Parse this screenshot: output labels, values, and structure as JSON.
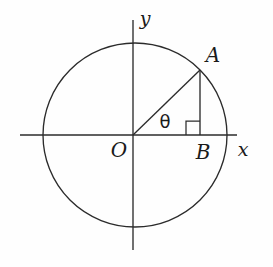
{
  "figure": {
    "background_color": "#fefefe",
    "stroke_color": "#2b2b2b",
    "labels": {
      "y_axis": "y",
      "x_axis": "x",
      "origin": "O",
      "point_a": "A",
      "point_b": "B",
      "angle": "θ"
    },
    "geometry": {
      "circle": {
        "cx": 135,
        "cy": 135,
        "r": 92
      },
      "x_axis_line": {
        "x1": 20,
        "y1": 135,
        "x2": 237,
        "y2": 135
      },
      "y_axis_line": {
        "x1": 133,
        "y1": 20,
        "x2": 133,
        "y2": 250
      },
      "radius_segment_OA": {
        "x1": 133,
        "y1": 135,
        "x2": 200,
        "y2": 70
      },
      "vertical_segment_AB": {
        "x1": 200,
        "y1": 70,
        "x2": 200,
        "y2": 135
      },
      "right_angle_marker": {
        "x": 186,
        "y": 120,
        "size": 14
      },
      "point_a_coords": {
        "x": 200,
        "y": 70
      },
      "point_b_coords": {
        "x": 200,
        "y": 135
      },
      "origin_coords": {
        "x": 133,
        "y": 135
      }
    },
    "label_positions": {
      "y_axis": {
        "x": 145,
        "y": 18
      },
      "x_axis": {
        "x": 243,
        "y": 149
      },
      "origin": {
        "x": 119,
        "y": 150
      },
      "point_a": {
        "x": 213,
        "y": 55
      },
      "point_b": {
        "x": 203,
        "y": 152
      },
      "angle": {
        "x": 165,
        "y": 122
      }
    }
  }
}
